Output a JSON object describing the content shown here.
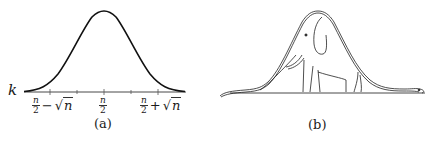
{
  "figure": {
    "panel_a": {
      "caption": "(a)",
      "y_label": "k",
      "ticks": [
        {
          "num": "n",
          "den": "2",
          "op": "−",
          "radicand": "n"
        },
        {
          "num": "n",
          "den": "2"
        },
        {
          "num": "n",
          "den": "2",
          "op": "+",
          "radicand": "n"
        }
      ],
      "curve": "Gaussian bell curve centered at n/2"
    },
    "panel_b": {
      "caption": "(b)",
      "drawing": "elephant inside a boa constrictor (bell-shaped outline)"
    },
    "colors": {
      "ink": "#1a1a1a",
      "background": "#ffffff"
    }
  }
}
